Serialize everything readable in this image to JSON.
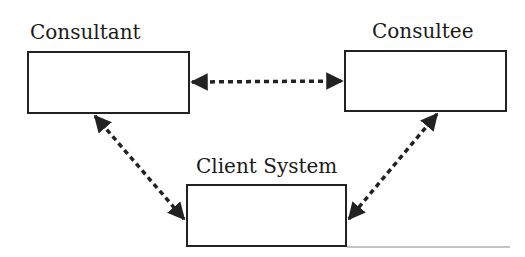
{
  "diagram": {
    "nodes": [
      {
        "id": "consultant",
        "label": "Consultant"
      },
      {
        "id": "consultee",
        "label": "Consultee"
      },
      {
        "id": "client",
        "label": "Client System"
      }
    ],
    "edges": [
      {
        "from": "consultant",
        "to": "consultee",
        "style": "dashed",
        "direction": "both"
      },
      {
        "from": "consultant",
        "to": "client",
        "style": "dashed",
        "direction": "both"
      },
      {
        "from": "consultee",
        "to": "client",
        "style": "dashed",
        "direction": "both"
      }
    ]
  }
}
